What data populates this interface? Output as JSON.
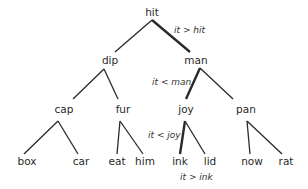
{
  "diagram": {
    "type": "binary-search-tree",
    "nodes": [
      {
        "id": "hit",
        "label": "hit",
        "x": 152,
        "y": 16
      },
      {
        "id": "dip",
        "label": "dip",
        "x": 110,
        "y": 64
      },
      {
        "id": "man",
        "label": "man",
        "x": 196,
        "y": 64
      },
      {
        "id": "cap",
        "label": "cap",
        "x": 64,
        "y": 113
      },
      {
        "id": "fur",
        "label": "fur",
        "x": 123,
        "y": 113
      },
      {
        "id": "joy",
        "label": "joy",
        "x": 186,
        "y": 113
      },
      {
        "id": "pan",
        "label": "pan",
        "x": 246,
        "y": 113
      },
      {
        "id": "box",
        "label": "box",
        "x": 27,
        "y": 165
      },
      {
        "id": "car",
        "label": "car",
        "x": 81,
        "y": 165
      },
      {
        "id": "eat",
        "label": "eat",
        "x": 117,
        "y": 165
      },
      {
        "id": "him",
        "label": "him",
        "x": 145,
        "y": 165
      },
      {
        "id": "ink",
        "label": "ink",
        "x": 180,
        "y": 165
      },
      {
        "id": "lid",
        "label": "lid",
        "x": 210,
        "y": 165
      },
      {
        "id": "now",
        "label": "now",
        "x": 252,
        "y": 165
      },
      {
        "id": "rat",
        "label": "rat",
        "x": 286,
        "y": 165
      }
    ],
    "edges": [
      {
        "from": "hit",
        "to": "dip",
        "x1": 152,
        "y1": 20,
        "x2": 115,
        "y2": 52,
        "bold": false
      },
      {
        "from": "hit",
        "to": "man",
        "x1": 152,
        "y1": 20,
        "x2": 190,
        "y2": 52,
        "bold": true
      },
      {
        "from": "dip",
        "to": "cap",
        "x1": 104,
        "y1": 69,
        "x2": 73,
        "y2": 99,
        "bold": false
      },
      {
        "from": "dip",
        "to": "fur",
        "x1": 104,
        "y1": 69,
        "x2": 118,
        "y2": 99,
        "bold": false
      },
      {
        "from": "man",
        "to": "joy",
        "x1": 200,
        "y1": 68,
        "x2": 186,
        "y2": 99,
        "bold": true
      },
      {
        "from": "man",
        "to": "pan",
        "x1": 200,
        "y1": 68,
        "x2": 233,
        "y2": 99,
        "bold": false
      },
      {
        "from": "cap",
        "to": "box",
        "x1": 58,
        "y1": 121,
        "x2": 24,
        "y2": 154,
        "bold": false
      },
      {
        "from": "cap",
        "to": "car",
        "x1": 58,
        "y1": 121,
        "x2": 78,
        "y2": 154,
        "bold": false
      },
      {
        "from": "fur",
        "to": "eat",
        "x1": 120,
        "y1": 121,
        "x2": 117,
        "y2": 154,
        "bold": false
      },
      {
        "from": "fur",
        "to": "him",
        "x1": 120,
        "y1": 121,
        "x2": 143,
        "y2": 154,
        "bold": false
      },
      {
        "from": "joy",
        "to": "ink",
        "x1": 185,
        "y1": 121,
        "x2": 180,
        "y2": 154,
        "bold": true
      },
      {
        "from": "joy",
        "to": "lid",
        "x1": 185,
        "y1": 121,
        "x2": 205,
        "y2": 154,
        "bold": false
      },
      {
        "from": "pan",
        "to": "now",
        "x1": 247,
        "y1": 121,
        "x2": 250,
        "y2": 154,
        "bold": false
      },
      {
        "from": "pan",
        "to": "rat",
        "x1": 247,
        "y1": 121,
        "x2": 282,
        "y2": 154,
        "bold": false
      }
    ],
    "annotations": [
      {
        "text": "it > hit",
        "x": 174,
        "y": 33
      },
      {
        "text": "it < man",
        "x": 152,
        "y": 85
      },
      {
        "text": "it < joy",
        "x": 148,
        "y": 138
      },
      {
        "text": "it > ink",
        "x": 180,
        "y": 180
      }
    ]
  }
}
